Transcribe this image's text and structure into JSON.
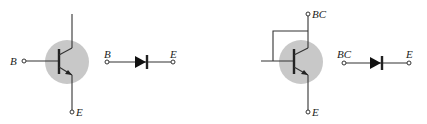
{
  "diagram": {
    "left_circuit": {
      "transistor": {
        "type": "npn",
        "body_color": "#c8c8c8",
        "terminals": {
          "base": "B",
          "emitter": "E"
        }
      },
      "equivalent_diode": {
        "anode_label": "B",
        "cathode_label": "E"
      }
    },
    "right_circuit": {
      "transistor": {
        "type": "npn",
        "connection": "base tied to collector",
        "body_color": "#c8c8c8",
        "terminals": {
          "base_collector": "BC",
          "emitter": "E"
        }
      },
      "equivalent_diode": {
        "anode_label": "BC",
        "cathode_label": "E"
      }
    }
  }
}
